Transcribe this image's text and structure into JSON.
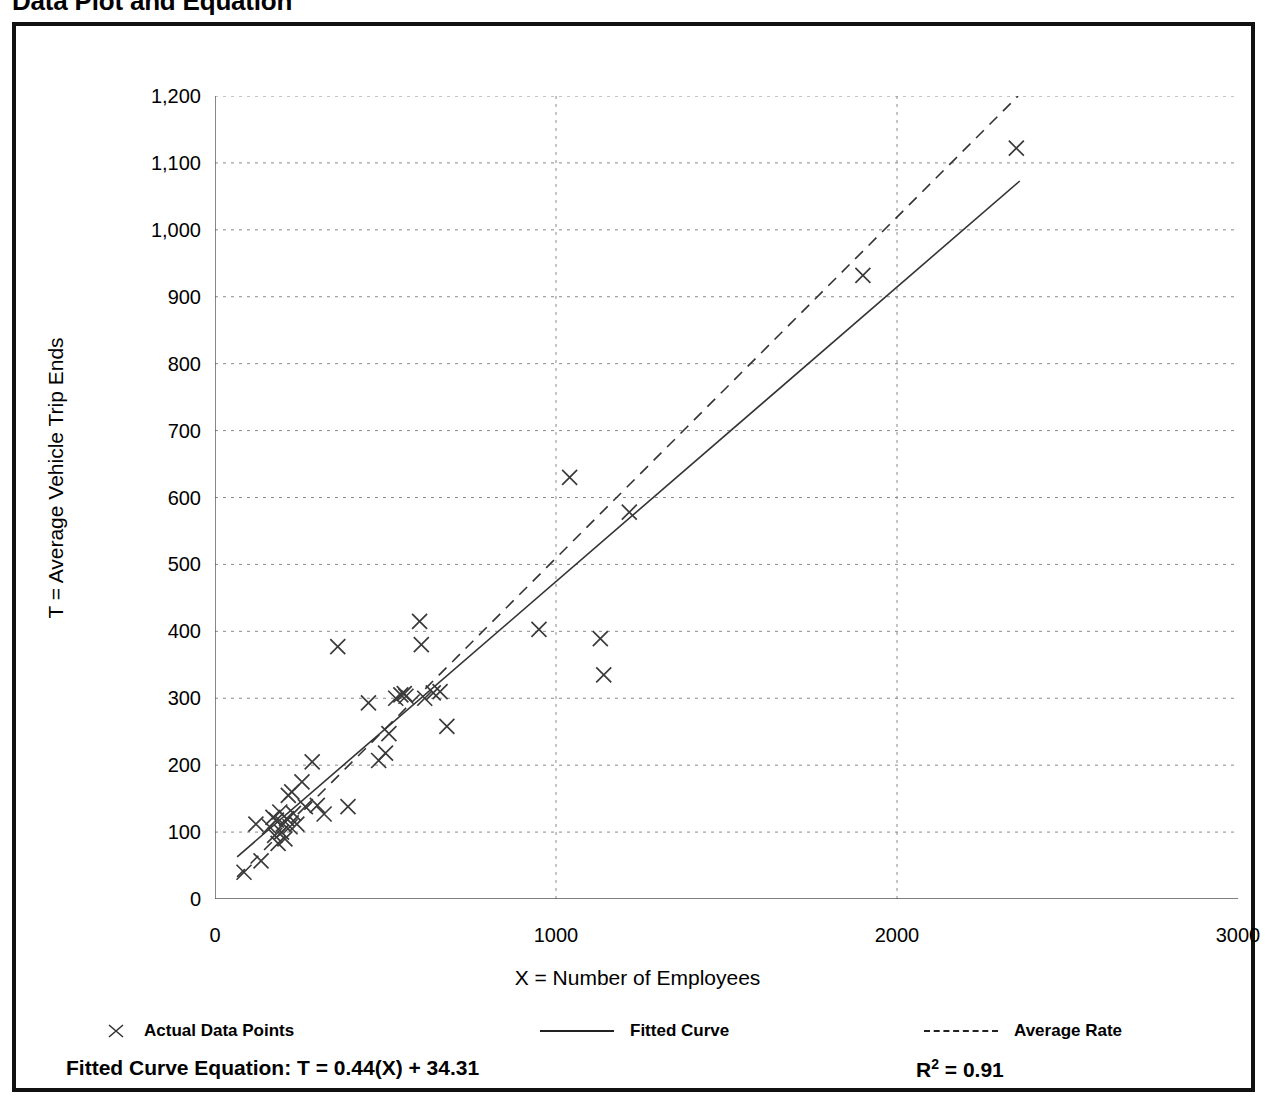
{
  "page": {
    "title": "Data Plot and Equation"
  },
  "axes": {
    "y_title": "T = Average Vehicle Trip Ends",
    "x_title": "X = Number of Employees",
    "y_ticks": [
      "0",
      "100",
      "200",
      "300",
      "400",
      "500",
      "600",
      "700",
      "800",
      "900",
      "1,000",
      "1,100",
      "1,200"
    ],
    "x_ticks": [
      "0",
      "1000",
      "2000",
      "3000"
    ]
  },
  "legend": {
    "items": [
      {
        "label": "Actual Data Points",
        "swatch": "x-marker-icon"
      },
      {
        "label": "Fitted Curve",
        "swatch": "solid-line-icon"
      },
      {
        "label": "Average Rate",
        "swatch": "dashed-line-icon"
      }
    ]
  },
  "equation": {
    "text": "Fitted Curve Equation:  T = 0.44(X) + 34.31",
    "r_squared_prefix": "R",
    "r_squared_exponent": "2",
    "r_squared_value": " = 0.91"
  },
  "chart_data": {
    "type": "scatter",
    "title": "Data Plot and Equation",
    "xlabel": "X = Number of Employees",
    "ylabel": "T = Average Vehicle Trip Ends",
    "xlim": [
      0,
      3000
    ],
    "ylim": [
      0,
      1200
    ],
    "x_tick_values": [
      0,
      1000,
      2000,
      3000
    ],
    "y_tick_values": [
      0,
      100,
      200,
      300,
      400,
      500,
      600,
      700,
      800,
      900,
      1000,
      1100,
      1200
    ],
    "y_minor_tick_step": 50,
    "grid": "dotted horizontal gridlines every 100 and dotted vertical gridlines at 1000 and 2000",
    "legend_position": "below plot",
    "marker": "x",
    "points": [
      [
        85,
        40
      ],
      [
        120,
        112
      ],
      [
        135,
        57
      ],
      [
        160,
        108
      ],
      [
        170,
        122
      ],
      [
        175,
        95
      ],
      [
        180,
        118
      ],
      [
        185,
        83
      ],
      [
        190,
        130
      ],
      [
        195,
        100
      ],
      [
        200,
        112
      ],
      [
        205,
        90
      ],
      [
        210,
        120
      ],
      [
        215,
        155
      ],
      [
        220,
        108
      ],
      [
        225,
        160
      ],
      [
        230,
        128
      ],
      [
        240,
        112
      ],
      [
        255,
        175
      ],
      [
        265,
        138
      ],
      [
        285,
        205
      ],
      [
        300,
        140
      ],
      [
        320,
        127
      ],
      [
        360,
        377
      ],
      [
        390,
        138
      ],
      [
        450,
        293
      ],
      [
        480,
        207
      ],
      [
        500,
        218
      ],
      [
        510,
        247
      ],
      [
        530,
        300
      ],
      [
        545,
        305
      ],
      [
        555,
        307
      ],
      [
        560,
        303
      ],
      [
        600,
        415
      ],
      [
        605,
        380
      ],
      [
        615,
        300
      ],
      [
        640,
        308
      ],
      [
        660,
        310
      ],
      [
        680,
        258
      ],
      [
        950,
        403
      ],
      [
        1040,
        630
      ],
      [
        1130,
        389
      ],
      [
        1140,
        335
      ],
      [
        1215,
        578
      ],
      [
        1900,
        932
      ],
      [
        2350,
        1122
      ]
    ],
    "series": [
      {
        "name": "Fitted Curve",
        "type": "line",
        "style": "solid",
        "equation": "T = 0.44(X) + 34.31",
        "r_squared": 0.91,
        "x_range": [
          65,
          2360
        ],
        "y_range": [
          63,
          1073
        ]
      },
      {
        "name": "Average Rate",
        "type": "line",
        "style": "dashed",
        "x_range": [
          65,
          2355
        ],
        "y_range": [
          33,
          1200
        ]
      }
    ]
  }
}
